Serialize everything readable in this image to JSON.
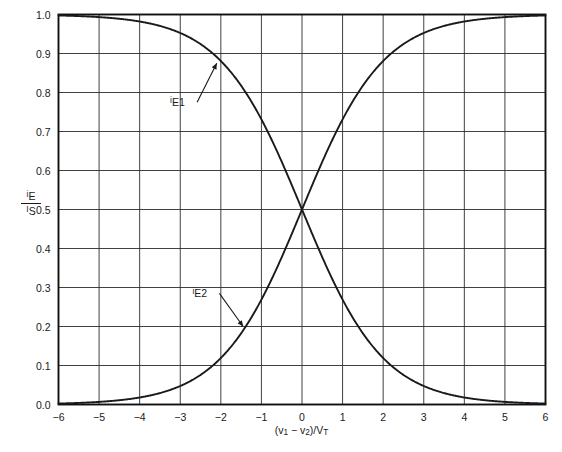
{
  "chart_data": {
    "type": "line",
    "title": "",
    "xlabel": "(v₁ − v₂)/V_T",
    "ylabel": "i_E / I_S",
    "xlim": [
      -6,
      6
    ],
    "ylim": [
      0.0,
      1.0
    ],
    "grid": true,
    "legend_position": "inline-annotations",
    "xticks": [
      "−6",
      "−5",
      "−4",
      "−3",
      "−2",
      "−1",
      "0",
      "1",
      "2",
      "3",
      "4",
      "5",
      "6"
    ],
    "xtick_values": [
      -6,
      -5,
      -4,
      -3,
      -2,
      -1,
      0,
      1,
      2,
      3,
      4,
      5,
      6
    ],
    "yticks": [
      "0.0",
      "0.1",
      "0.2",
      "0.3",
      "0.4",
      "0.5",
      "0.6",
      "0.7",
      "0.8",
      "0.9",
      "1.0"
    ],
    "ytick_values": [
      0.0,
      0.1,
      0.2,
      0.3,
      0.4,
      0.5,
      0.6,
      0.7,
      0.8,
      0.9,
      1.0
    ],
    "x": [
      -6,
      -5.5,
      -5,
      -4.5,
      -4,
      -3.5,
      -3,
      -2.5,
      -2,
      -1.5,
      -1,
      -0.5,
      0,
      0.5,
      1,
      1.5,
      2,
      2.5,
      3,
      3.5,
      4,
      4.5,
      5,
      5.5,
      6
    ],
    "series": [
      {
        "name": "iE1",
        "formula": "1/(1+exp(x))",
        "color": "#1a1a1a",
        "values": [
          0.9975,
          0.9959,
          0.9933,
          0.989,
          0.982,
          0.9707,
          0.9526,
          0.9241,
          0.8808,
          0.8176,
          0.7311,
          0.6225,
          0.5,
          0.3775,
          0.2689,
          0.1824,
          0.1192,
          0.0759,
          0.0474,
          0.0293,
          0.018,
          0.011,
          0.0067,
          0.0041,
          0.0025
        ]
      },
      {
        "name": "iE2",
        "formula": "1/(1+exp(-x))",
        "color": "#1a1a1a",
        "values": [
          0.0025,
          0.0041,
          0.0067,
          0.011,
          0.018,
          0.0293,
          0.0474,
          0.0759,
          0.1192,
          0.1824,
          0.2689,
          0.3775,
          0.5,
          0.6225,
          0.7311,
          0.8176,
          0.8808,
          0.9241,
          0.9526,
          0.9707,
          0.982,
          0.989,
          0.9933,
          0.9959,
          0.9975
        ]
      }
    ],
    "annotations": [
      {
        "label": "iE1",
        "label_html_num": "i",
        "label_html_sub": "E1",
        "text_x": -3.25,
        "text_y": 0.775,
        "arrow_to_x": -2.1,
        "arrow_to_y": 0.875
      },
      {
        "label": "iE2",
        "label_html_num": "i",
        "label_html_sub": "E2",
        "text_x": -2.7,
        "text_y": 0.285,
        "arrow_to_x": -1.45,
        "arrow_to_y": 0.2
      }
    ]
  },
  "labels": {
    "ylabel_numerator": "i",
    "ylabel_numerator_sub": "E",
    "ylabel_denominator": "I",
    "ylabel_denominator_sub": "S",
    "xlabel_open": "(",
    "xlabel_v1": "v",
    "xlabel_v1_sub": "1",
    "xlabel_minus": " − ",
    "xlabel_v2": "v",
    "xlabel_v2_sub": "2",
    "xlabel_close": ")/",
    "xlabel_vt": "V",
    "xlabel_vt_sub": "T",
    "curve1_prefix": "i",
    "curve1_sub": "E1",
    "curve2_prefix": "i",
    "curve2_sub": "E2"
  },
  "style": {
    "background": "#ffffff",
    "grid_color": "#2b2b2b",
    "axis_color": "#111111",
    "curve_color": "#1a1a1a",
    "text_color": "#1a1a1a"
  }
}
